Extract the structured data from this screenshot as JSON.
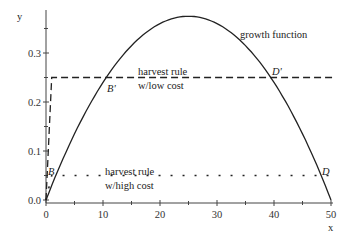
{
  "chart_data": {
    "type": "line",
    "title": "",
    "xlabel": "x",
    "ylabel": "y",
    "xlim": [
      0,
      50
    ],
    "ylim": [
      0,
      0.38
    ],
    "xticks": [
      0,
      10,
      20,
      30,
      40,
      50
    ],
    "yticks": [
      0.0,
      0.1,
      0.2,
      0.3
    ],
    "xtick_labels": [
      "0",
      "10",
      "20",
      "30",
      "40",
      "50"
    ],
    "ytick_labels": [
      "0.0",
      "0.1",
      "0.2",
      "0.3"
    ],
    "grid": false,
    "series": [
      {
        "name": "growth function",
        "style": "solid",
        "formula": "0.03*x*(1-x/50)",
        "peak": {
          "x": 25,
          "y": 0.375
        }
      },
      {
        "name": "harvest rule w/low cost",
        "style": "dashed",
        "level": 0.25,
        "ramp_x": 1
      },
      {
        "name": "harvest rule w/high cost",
        "style": "dotted",
        "level": 0.05,
        "ramp_x": 1
      }
    ],
    "annotations": [
      {
        "text": "growth function",
        "x": 34,
        "y": 0.33
      },
      {
        "text": "harvest rule",
        "x": 21,
        "y": 0.255
      },
      {
        "text": "w/low cost",
        "x": 21,
        "y": 0.235
      },
      {
        "text": "harvest rule",
        "x": 21,
        "y": 0.055
      },
      {
        "text": "w/high cost",
        "x": 21,
        "y": 0.035
      },
      {
        "text": "B'",
        "x": 11,
        "y": 0.24
      },
      {
        "text": "D'",
        "x": 39,
        "y": 0.255
      },
      {
        "text": "B",
        "x": 1.8,
        "y": 0.055
      },
      {
        "text": "D",
        "x": 48.3,
        "y": 0.055
      }
    ]
  },
  "labels": {
    "x_axis": "x",
    "y_axis": "y",
    "growth": "growth function",
    "low_1": "harvest rule",
    "low_2": "w/low cost",
    "high_1": "harvest rule",
    "high_2": "w/high cost",
    "B_prime": "B'",
    "D_prime": "D'",
    "B": "B",
    "D": "D"
  }
}
